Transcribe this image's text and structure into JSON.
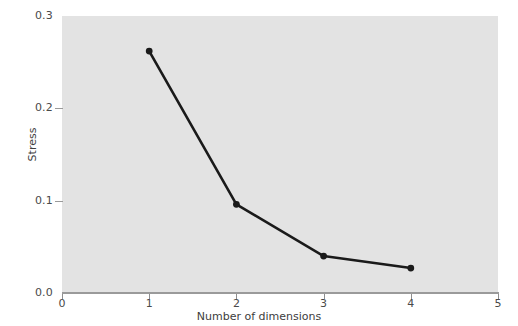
{
  "chart_data": {
    "type": "line",
    "title": "",
    "xlabel": "Number of dimensions",
    "ylabel": "Stress",
    "x": [
      1,
      2,
      3,
      4
    ],
    "values": [
      0.262,
      0.096,
      0.04,
      0.027
    ],
    "series": [
      {
        "name": "Stress",
        "x": [
          1,
          2,
          3,
          4
        ],
        "values": [
          0.262,
          0.096,
          0.04,
          0.027
        ]
      }
    ],
    "xlim": [
      0,
      5
    ],
    "ylim": [
      0.0,
      0.3
    ],
    "xticks": [
      "0",
      "1",
      "2",
      "3",
      "4",
      "5"
    ],
    "xtick_values": [
      0,
      1,
      2,
      3,
      4,
      5
    ],
    "yticks": [
      "0.0",
      "0.1",
      "0.2",
      "0.3"
    ],
    "ytick_values": [
      0.0,
      0.1,
      0.2,
      0.3
    ],
    "grid": false,
    "legend": null,
    "marker": "circle",
    "line_color": "#1a1a1a",
    "marker_color": "#1a1a1a",
    "plot_background": "#e3e3e3",
    "figure_background": "#ffffff",
    "axis_color": "#9a9a9a",
    "tick_label_color": "#4a4a4a"
  }
}
